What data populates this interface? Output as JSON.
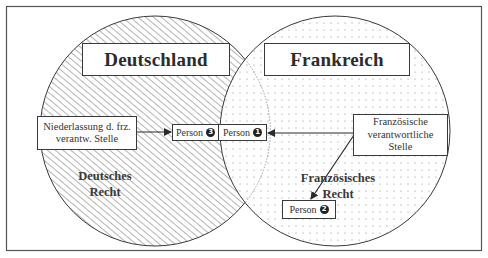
{
  "diagram": {
    "regions": [
      {
        "id": "germany",
        "title": "Deutschland",
        "law_label_line1": "Deutsches",
        "law_label_line2": "Recht",
        "fill": "hatched"
      },
      {
        "id": "france",
        "title": "Frankreich",
        "law_label_line1": "Französisches",
        "law_label_line2": "Recht",
        "fill": "dotted"
      }
    ],
    "nodes": {
      "niederlassung_line1": "Niederlassung d. frz.",
      "niederlassung_line2": "verantw. Stelle",
      "french_body_line1": "Französische",
      "french_body_line2": "verantwortliche",
      "french_body_line3": "Stelle",
      "person_label": "Person",
      "person1_num": "1",
      "person2_num": "2",
      "person3_num": "3"
    },
    "edges": [
      {
        "from": "Niederlassung d. frz. verantw. Stelle",
        "to": "Person 3"
      },
      {
        "from": "Französische verantwortliche Stelle",
        "to": "Person 1"
      },
      {
        "from": "Französische verantwortliche Stelle",
        "to": "Person 2"
      }
    ],
    "colors": {
      "line": "#3a3a3a",
      "frame": "#555555",
      "hatch": "#6a6a6a",
      "dots": "#8a8a8a"
    }
  }
}
